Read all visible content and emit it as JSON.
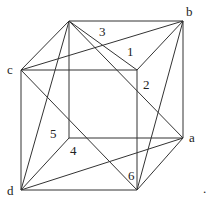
{
  "diagram": {
    "vertex_labels": {
      "a": "a",
      "b": "b",
      "c": "c",
      "d": "d"
    },
    "region_labels": {
      "r1": "1",
      "r2": "2",
      "r3": "3",
      "r4": "4",
      "r5": "5",
      "r6": "6"
    },
    "trailing_mark": ".",
    "line_color": "#333333"
  }
}
